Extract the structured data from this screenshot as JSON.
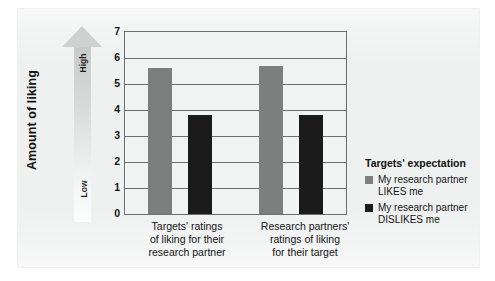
{
  "chart_data": {
    "type": "bar",
    "title": "",
    "xlabel": "",
    "ylabel": "Amount of liking",
    "ylim": [
      0,
      7
    ],
    "ytick_labels": [
      "7",
      "6",
      "5",
      "4",
      "3",
      "2",
      "1",
      "0"
    ],
    "ytick_values": [
      7,
      6,
      5,
      4,
      3,
      2,
      1,
      0
    ],
    "grid": true,
    "legend_position": "right",
    "axis_direction_high": "High",
    "axis_direction_low": "Low",
    "categories": [
      "Targets' ratings of liking for their research partner",
      "Research partners' ratings of liking for their target"
    ],
    "categories_lines": [
      [
        "Targets' ratings",
        "of liking for their",
        "research partner"
      ],
      [
        "Research partners'",
        "ratings of liking",
        "for their target"
      ]
    ],
    "series": [
      {
        "name": "My research partner LIKES me",
        "name_lines": [
          "My research partner",
          "LIKES me"
        ],
        "color": "#7d7e7e",
        "values": [
          5.6,
          5.7
        ]
      },
      {
        "name": "My research partner DISLIKES me",
        "name_lines": [
          "My research partner",
          "DISLIKES me"
        ],
        "color": "#1b1b1b",
        "values": [
          3.8,
          3.8
        ]
      }
    ],
    "legend_title": "Targets' expectation"
  },
  "legend": {
    "title": "Targets' expectation",
    "items": [
      {
        "line1": "My research partner",
        "line2": "LIKES me",
        "swatch": "likes"
      },
      {
        "line1": "My research partner",
        "line2": "DISLIKES me",
        "swatch": "dislikes"
      }
    ]
  },
  "axis": {
    "y_title": "Amount of liking",
    "high_label": "High",
    "low_label": "Low",
    "ticks": [
      "7",
      "6",
      "5",
      "4",
      "3",
      "2",
      "1",
      "0"
    ]
  },
  "xcats": {
    "cat0": {
      "l1": "Targets' ratings",
      "l2": "of liking for their",
      "l3": "research partner"
    },
    "cat1": {
      "l1": "Research partners'",
      "l2": "ratings of liking",
      "l3": "for their target"
    }
  }
}
